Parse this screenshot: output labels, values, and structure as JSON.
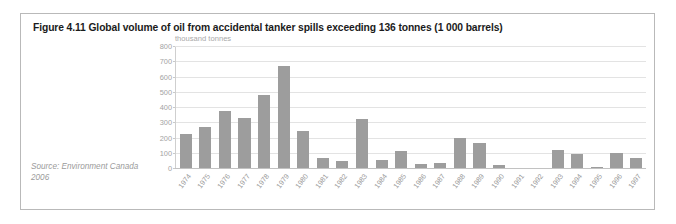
{
  "figure": {
    "title": "Figure 4.11 Global volume of oil from accidental tanker spills exceeding 136 tonnes (1 000 barrels)",
    "source": "Source: Environment Canada 2006"
  },
  "chart_data": {
    "type": "bar",
    "title": "Figure 4.11 Global volume of oil from accidental tanker spills exceeding 136 tonnes (1 000 barrels)",
    "xlabel": "",
    "ylabel": "thousand tonnes",
    "ylim": [
      0,
      800
    ],
    "yticks": [
      0,
      100,
      200,
      300,
      400,
      500,
      600,
      700,
      800
    ],
    "ytick_labels": [
      "0",
      "100",
      "200",
      "300",
      "400",
      "500",
      "600",
      "700",
      "800"
    ],
    "grid": true,
    "legend": false,
    "bar_color": "#9d9d9d",
    "categories": [
      "1974",
      "1975",
      "1976",
      "1977",
      "1978",
      "1979",
      "1980",
      "1981",
      "1982",
      "1983",
      "1984",
      "1985",
      "1986",
      "1987",
      "1988",
      "1989",
      "1990",
      "1991",
      "1992",
      "1993",
      "1994",
      "1995",
      "1996",
      "1997"
    ],
    "values": [
      225,
      270,
      375,
      330,
      485,
      675,
      245,
      65,
      45,
      325,
      50,
      115,
      25,
      30,
      200,
      165,
      20,
      0,
      0,
      120,
      95,
      5,
      100,
      65
    ]
  }
}
